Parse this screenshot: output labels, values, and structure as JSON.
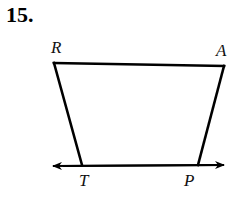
{
  "problem": {
    "number": "15."
  },
  "figure": {
    "type": "quadrilateral",
    "vertices": [
      {
        "name": "R",
        "x": 54,
        "y": 63,
        "label_x": 51,
        "label_y": 53
      },
      {
        "name": "A",
        "x": 224,
        "y": 66,
        "label_x": 216,
        "label_y": 56
      },
      {
        "name": "P",
        "x": 198,
        "y": 165,
        "label_x": 184,
        "label_y": 186
      },
      {
        "name": "T",
        "x": 82,
        "y": 165,
        "label_x": 79,
        "label_y": 186
      }
    ],
    "line": {
      "through": [
        "T",
        "P"
      ],
      "x1": 53,
      "y1": 166,
      "x2": 224,
      "y2": 165,
      "arrows": "both"
    },
    "stroke_color": "#000000"
  }
}
